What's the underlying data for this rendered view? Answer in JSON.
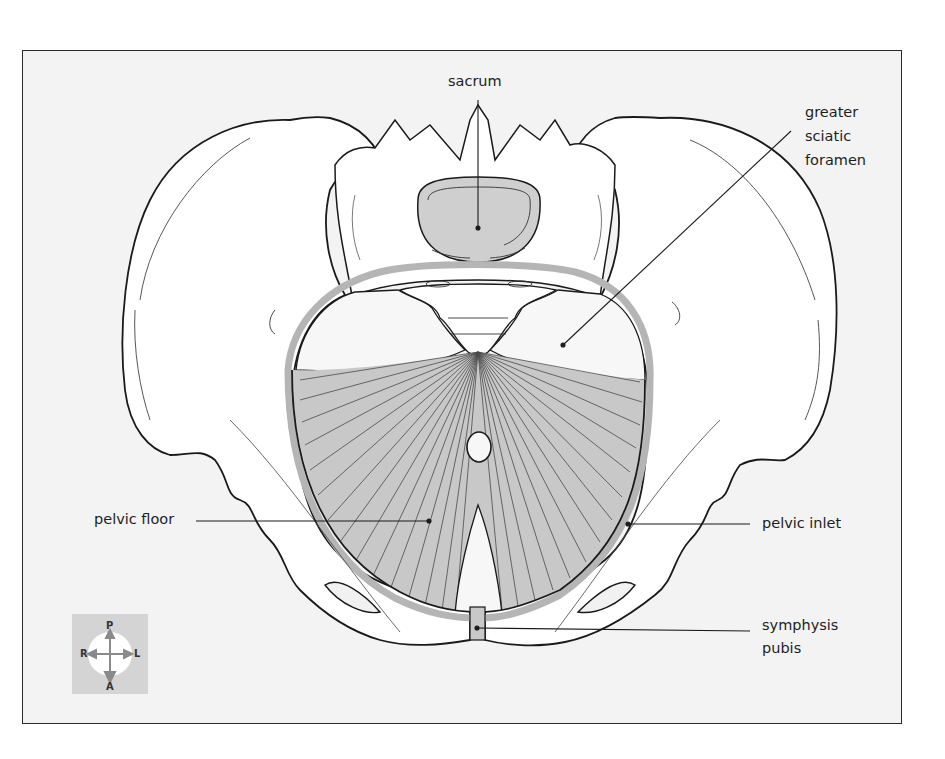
{
  "figure": {
    "type": "anatomical-diagram",
    "colors": {
      "frame_background": "#f3f3f3",
      "bone_fill": "#ffffff",
      "outline": "#1a1a1a",
      "muscle_fill": "#c8c8c8",
      "inlet_ring": "#b5b5b5",
      "sacrum_fill": "#cfcfcf",
      "compass_background": "#d4d4d4"
    }
  },
  "labels": {
    "sacrum": "sacrum",
    "greater_sciatic_foramen": "greater\nsciatic\nforamen",
    "pelvic_floor": "pelvic floor",
    "pelvic_inlet": "pelvic inlet",
    "symphysis_pubis": "symphysis\npubis"
  },
  "orientation_compass": {
    "top": "P",
    "bottom": "A",
    "left": "R",
    "right": "L"
  }
}
